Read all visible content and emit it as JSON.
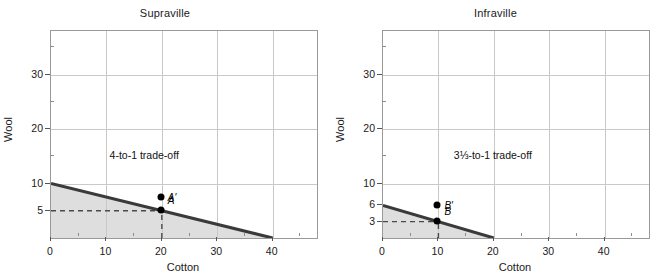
{
  "figure": {
    "background": "#ffffff",
    "frontier_color": "#3a3a3a",
    "shade_color": "#dedede",
    "grid_color": "#c9c9c9",
    "point_color": "#000000"
  },
  "chart_data": [
    {
      "type": "line",
      "title": "Supraville",
      "xlabel": "Cotton",
      "ylabel": "Wool",
      "xlim": [
        0,
        48
      ],
      "ylim": [
        0,
        38
      ],
      "grid": true,
      "legend": null,
      "xticks": [
        0,
        10,
        20,
        30,
        40
      ],
      "xticklabels": [
        "0",
        "10",
        "20",
        "30",
        "40"
      ],
      "xminorticks": [
        5,
        15,
        25,
        35,
        45
      ],
      "yticks": [
        5,
        10,
        20,
        30
      ],
      "yticklabels": [
        "5",
        "10",
        "20",
        "30"
      ],
      "yminorticks": [
        15,
        25,
        35
      ],
      "series": [
        {
          "name": "production possibility frontier",
          "x": [
            0,
            40
          ],
          "y": [
            10,
            0
          ]
        }
      ],
      "annotations": [
        {
          "text": "4-to-1 trade-off",
          "x": 17,
          "y": 15
        }
      ],
      "points": [
        {
          "label": "A′",
          "x": 20,
          "y": 7.4,
          "label_dx": 7,
          "label_dy": 0
        },
        {
          "label": "A",
          "x": 20,
          "y": 5.0,
          "label_dx": 7,
          "label_dy": -10
        }
      ],
      "guides": [
        {
          "from": [
            0,
            5
          ],
          "to": [
            20,
            5
          ],
          "style": "dashed"
        },
        {
          "from": [
            20,
            0
          ],
          "to": [
            20,
            5
          ],
          "style": "dashed"
        }
      ],
      "shaded_region": "area under frontier"
    },
    {
      "type": "line",
      "title": "Infraville",
      "xlabel": "Cotton",
      "ylabel": "Wool",
      "xlim": [
        0,
        48
      ],
      "ylim": [
        0,
        38
      ],
      "grid": true,
      "legend": null,
      "xticks": [
        0,
        10,
        20,
        30,
        40
      ],
      "xticklabels": [
        "0",
        "10",
        "20",
        "30",
        "40"
      ],
      "xminorticks": [
        5,
        15,
        25,
        35,
        45
      ],
      "yticks": [
        3,
        6,
        10,
        20,
        30
      ],
      "yticklabels": [
        "3",
        "6",
        "10",
        "20",
        "30"
      ],
      "yminorticks": [
        15,
        25,
        35
      ],
      "series": [
        {
          "name": "production possibility frontier",
          "x": [
            0,
            20
          ],
          "y": [
            6,
            0
          ]
        }
      ],
      "annotations": [
        {
          "text": "3⅓-to-1 trade-off",
          "x": 20,
          "y": 15
        }
      ],
      "points": [
        {
          "label": "B′",
          "x": 10,
          "y": 5.9,
          "label_dx": 7,
          "label_dy": 0
        },
        {
          "label": "B",
          "x": 10,
          "y": 3.0,
          "label_dx": 7,
          "label_dy": -10
        }
      ],
      "guides": [
        {
          "from": [
            0,
            3
          ],
          "to": [
            10,
            3
          ],
          "style": "dashed"
        },
        {
          "from": [
            10,
            0
          ],
          "to": [
            10,
            3
          ],
          "style": "dashed"
        }
      ],
      "shaded_region": "area under frontier"
    }
  ]
}
